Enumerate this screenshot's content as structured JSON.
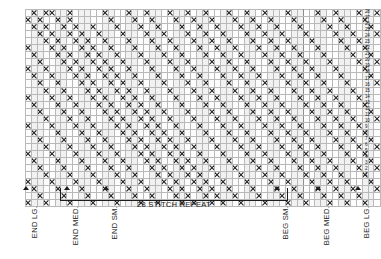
{
  "chart_data": {
    "type": "heatmap",
    "xlabel": "",
    "ylabel": "",
    "grid": true,
    "legend_position": "none",
    "rows": 28,
    "columns": 60,
    "cell_symbol": "X",
    "symbol_meaning": "contrast-color stitch",
    "blank_meaning": "main-color stitch",
    "row_numbers": [
      28,
      27,
      26,
      25,
      24,
      23,
      22,
      21,
      20,
      19,
      18,
      17,
      16,
      15,
      14,
      13,
      12,
      11,
      10,
      9,
      8,
      7,
      6,
      5,
      4,
      3,
      2,
      1
    ],
    "row_number_side": "right",
    "repeat_start_column": 7,
    "repeat_end_column": 46,
    "matrix": [
      "010110010000010001001000100100100010010010001000010010001001",
      "101001010000001000100100010010010001001001000100001001000100",
      "010100101001000100010010001001001000100100100010000100100010",
      "001010010100100010001001000100100100010010010001000010010001",
      "000101001010010001000100100010010010001001001000100001001000",
      "100010100101001000100010010001001001000100100100010000100100",
      "010001010010100100010001001000100100100010010010001000010010",
      "001000101001010010001000100100010010010001001001000100001001",
      "100100010100101001000100010010001001001000100100100010000100",
      "010010001010010100100010001001000100100100010010010001000010",
      "001001000101001010010001000100100010010010001001001000100001",
      "000100100010100101001000100010010001001001000100100100010000",
      "100010010001010010100100010001001000100100100010010010001000",
      "010001001000101001010010001000100100010010010001001001000100",
      "001000100100010100101001000100010010001001001000100100100010",
      "000100010010001010010100100010001001000100100100010010010001",
      "100010001001000101001010010001000100100010010010001001001000",
      "010001000100100010100101001000100010010001001001000100100100",
      "001000100010010001010010100100010001001000100100100010010010",
      "000100010001001000101001010010001000100100010010010001001001",
      "100010001000100100010100101001000100010010001001001000100100",
      "010001000100010010001010010100100010001001000100100100010010",
      "001000100010001001000101001010010001000100100010010010001001",
      "000100010001000100100010100101001000100010010001001001000100",
      "100010001000100010010001010010100100010001001000100100100010",
      "010001000100010001001000101001010010001000100100010010010001",
      "001000100010001000100100010100101001000100010010001001001000",
      "100100010001000100010010001010010100100010001001000100100100"
    ]
  },
  "markers": [
    {
      "id": "end-lg",
      "label": "END LG.",
      "x": 26
    },
    {
      "id": "end-med",
      "label": "END MED.",
      "x": 67
    },
    {
      "id": "end-sm",
      "label": "END SM.",
      "x": 106
    },
    {
      "id": "beg-sm",
      "label": "BEG SM.",
      "x": 277
    },
    {
      "id": "beg-med",
      "label": "BEG MED.",
      "x": 318
    },
    {
      "id": "beg-lg",
      "label": "BEG LG.",
      "x": 358
    }
  ],
  "repeat": {
    "label": "28 STITCH REPEAT",
    "left": 60,
    "width": 228
  },
  "colors": {
    "symbol": "#1d1d1d",
    "gridline": "#b9b9b9",
    "gridline_heavy": "#8d8d8d",
    "cell_light": "#fdfdfd",
    "cell_shade": "#f1f1f1",
    "background": "#ffffff"
  }
}
